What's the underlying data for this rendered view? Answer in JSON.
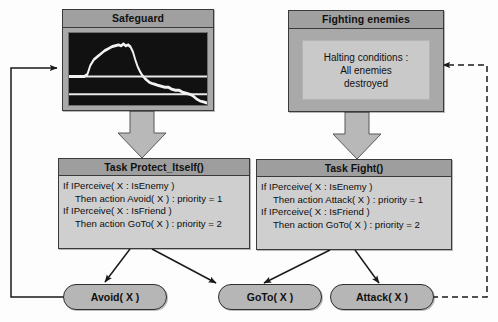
{
  "diagram": {
    "colors": {
      "module_fill": "#a9a9a9",
      "module_title_fill": "#a0a0a0",
      "task_fill": "#cfcfcf",
      "task_title_fill": "#9e9e9e",
      "action_fill": "#b6b6b6",
      "halting_fill": "#c9c9c9",
      "scope_background": "#111111",
      "scope_trace": "#f2f2f2",
      "arrow_fill": "#b8b8b8",
      "edge_stroke": "#1a1a1a",
      "border": "#3a3a3a"
    },
    "modules": [
      {
        "id": "safeguard",
        "title": "Safeguard",
        "content_type": "signal-scope"
      },
      {
        "id": "fighting-enemies",
        "title": "Fighting enemies",
        "content_type": "halting-conditions",
        "halting": {
          "line1": "Halting conditions :",
          "line2": "All enemies",
          "line3": "destroyed"
        }
      }
    ],
    "tasks": [
      {
        "id": "task-protect-itself",
        "title": "Task Protect_Itself()",
        "rules": [
          {
            "text": "If IPerceive( X : IsEnemy )",
            "indent": false
          },
          {
            "text": "Then action Avoid( X ) : priority = 1",
            "indent": true
          },
          {
            "text": "If IPerceive( X : IsFriend )",
            "indent": false
          },
          {
            "text": "Then action GoTo( X ) : priority = 2",
            "indent": true
          }
        ]
      },
      {
        "id": "task-fight",
        "title": "Task Fight()",
        "rules": [
          {
            "text": "If IPerceive( X : IsEnemy )",
            "indent": false
          },
          {
            "text": "Then action Attack( X )  : priority = 1",
            "indent": true
          },
          {
            "text": "If IPerceive( X : IsFriend )",
            "indent": false
          },
          {
            "text": "Then action GoTo( X ) : priority = 2",
            "indent": true
          }
        ]
      }
    ],
    "actions": [
      {
        "id": "action-avoid",
        "label": "Avoid( X )"
      },
      {
        "id": "action-goto",
        "label": "GoTo( X )"
      },
      {
        "id": "action-attack",
        "label": "Attack( X )"
      }
    ],
    "connectors": [
      {
        "id": "safeguard-to-protect",
        "kind": "block-arrow",
        "from": "safeguard",
        "to": "task-protect-itself"
      },
      {
        "id": "fighting-to-fight",
        "kind": "block-arrow",
        "from": "fighting-enemies",
        "to": "task-fight"
      },
      {
        "id": "protect-to-avoid",
        "kind": "arrow",
        "from": "task-protect-itself",
        "to": "action-avoid"
      },
      {
        "id": "protect-to-goto",
        "kind": "arrow",
        "from": "task-protect-itself",
        "to": "action-goto"
      },
      {
        "id": "fight-to-goto",
        "kind": "arrow",
        "from": "task-fight",
        "to": "action-goto"
      },
      {
        "id": "fight-to-attack",
        "kind": "arrow",
        "from": "task-fight",
        "to": "action-attack"
      },
      {
        "id": "avoid-feedback",
        "kind": "solid-feedback",
        "from": "action-avoid",
        "to": "safeguard"
      },
      {
        "id": "attack-feedback",
        "kind": "dashed-feedback",
        "from": "action-attack",
        "to": "fighting-enemies"
      }
    ],
    "scope_trace": {
      "description": "noisy signal rising to a plateau then decaying",
      "points": "0,44 26,44 31,42 36,33 42,27 48,24 54,21 60,18 66,16 72,14 78,13 84,12 88,13 92,11 96,13 100,12 104,14 108,19 112,27 116,34 120,39 124,43 128,46 132,48 136,50 140,51 145,52 150,53 156,54 162,55 168,55 174,57 180,58 186,58 192,60 198,61 204,62 210,64 216,67 222,69 228,70 234,71 240,72"
    }
  }
}
